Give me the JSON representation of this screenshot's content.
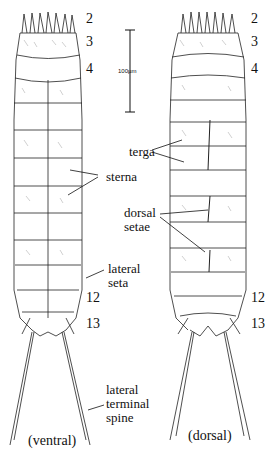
{
  "figure": {
    "views": [
      {
        "id": "ventral",
        "caption": "(ventral)"
      },
      {
        "id": "dorsal",
        "caption": "(dorsal)"
      }
    ],
    "scale_bar": {
      "label": "100µm"
    },
    "segment_numbers": {
      "ventral": [
        "2",
        "3",
        "4",
        "12",
        "13"
      ],
      "dorsal": [
        "2",
        "3",
        "4",
        "12",
        "13"
      ]
    },
    "annotations": {
      "sterna": "sterna",
      "terga": "terga",
      "dorsal_setae": [
        "dorsal",
        "setae"
      ],
      "lateral_seta": [
        "lateral",
        "seta"
      ],
      "lateral_terminal_spine": [
        "lateral",
        "terminal",
        "spine"
      ]
    }
  }
}
